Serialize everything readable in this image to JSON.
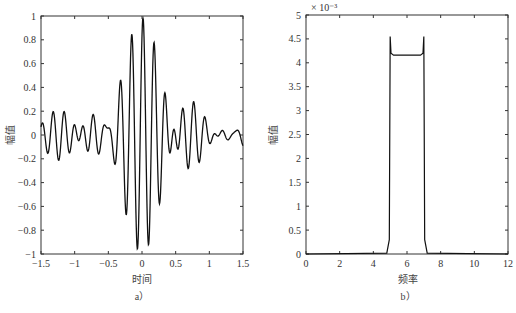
{
  "chart_data": [
    {
      "panel": "a",
      "type": "line",
      "caption": "a）",
      "title": "",
      "xlabel": "时间",
      "ylabel": "幅值",
      "xlim": [
        -1.5,
        1.5
      ],
      "ylim": [
        -1,
        1
      ],
      "xticks": [
        -1.5,
        -1,
        -0.5,
        0,
        0.5,
        1,
        1.5
      ],
      "xtick_labels": [
        "−1.5",
        "−1",
        "−0.5",
        "0",
        "0.5",
        "1",
        "1.5"
      ],
      "yticks": [
        -1,
        -0.8,
        -0.6,
        -0.4,
        -0.2,
        0,
        0.2,
        0.4,
        0.6,
        0.8,
        1
      ],
      "ytick_labels": [
        "−1",
        "−0.8",
        "−0.6",
        "−0.4",
        "−0.2",
        "0",
        "0.2",
        "0.4",
        "0.6",
        "0.8",
        "1"
      ],
      "grid": false,
      "description": "Band-limited chirp-like signal (sinc-modulated cosine), peak near t=0",
      "x": [
        -1.5,
        -1.45,
        -1.4,
        -1.35,
        -1.3,
        -1.25,
        -1.2,
        -1.15,
        -1.1,
        -1.05,
        -1.0,
        -0.95,
        -0.9,
        -0.85,
        -0.8,
        -0.75,
        -0.7,
        -0.65,
        -0.6,
        -0.55,
        -0.5,
        -0.45,
        -0.4,
        -0.35,
        -0.3,
        -0.25,
        -0.2,
        -0.15,
        -0.1,
        -0.05,
        0.0,
        0.05,
        0.1,
        0.15,
        0.2,
        0.25,
        0.3,
        0.35,
        0.4,
        0.45,
        0.5,
        0.55,
        0.6,
        0.65,
        0.7,
        0.75,
        0.8,
        0.85,
        0.9,
        0.95,
        1.0,
        1.05,
        1.1,
        1.15,
        1.2,
        1.25,
        1.3,
        1.35,
        1.4,
        1.45,
        1.5
      ],
      "key_points": {
        "max": {
          "x": 0.02,
          "y": 0.98
        },
        "min": {
          "x": -0.05,
          "y": -0.97
        },
        "peaks": [
          {
            "x": -0.4,
            "y": 0.53
          },
          {
            "x": -0.15,
            "y": 0.9
          },
          {
            "x": 0.02,
            "y": 0.98
          },
          {
            "x": 0.18,
            "y": 0.72
          },
          {
            "x": 0.35,
            "y": 0.3
          }
        ],
        "troughs": [
          {
            "x": -0.8,
            "y": -0.18
          },
          {
            "x": -0.4,
            "y": -0.3
          },
          {
            "x": -0.2,
            "y": -0.72
          },
          {
            "x": -0.05,
            "y": -0.97
          },
          {
            "x": 0.12,
            "y": -0.9
          },
          {
            "x": 0.28,
            "y": -0.52
          },
          {
            "x": 0.7,
            "y": -0.2
          }
        ]
      }
    },
    {
      "panel": "b",
      "type": "line",
      "caption": "b）",
      "title": "",
      "xlabel": "频率",
      "ylabel": "幅值",
      "y_multiplier": "× 10⁻³",
      "xlim": [
        0,
        12
      ],
      "ylim": [
        0,
        5
      ],
      "xticks": [
        0,
        2,
        4,
        6,
        8,
        10,
        12
      ],
      "xtick_labels": [
        "0",
        "2",
        "4",
        "6",
        "8",
        "10",
        "12"
      ],
      "yticks": [
        0,
        0.5,
        1,
        1.5,
        2,
        2.5,
        3,
        3.5,
        4,
        4.5,
        5
      ],
      "ytick_labels": [
        "0",
        "0.5",
        "1",
        "1.5",
        "2",
        "2.5",
        "3",
        "3.5",
        "4",
        "4.5",
        "5"
      ],
      "grid": false,
      "description": "Rectangular spectrum (passband 5–7) with Gibbs overshoot at edges",
      "x": [
        0,
        4.8,
        4.95,
        5.0,
        5.05,
        5.2,
        6.0,
        6.8,
        6.95,
        7.0,
        7.05,
        7.2,
        12
      ],
      "values": [
        0,
        0.02,
        0.3,
        4.55,
        4.2,
        4.16,
        4.16,
        4.16,
        4.2,
        4.55,
        0.3,
        0.02,
        0
      ],
      "units_scale": 0.001
    }
  ]
}
